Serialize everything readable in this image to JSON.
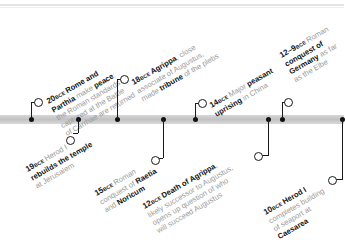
{
  "timeline": {
    "events": [
      {
        "id": "20bce",
        "year": "20",
        "era": "BCE",
        "lines": [
          [
            {
              "t": "Rome and",
              "b": true
            }
          ],
          [
            {
              "t": "Parthia",
              "b": true
            },
            {
              "t": " make ",
              "b": false
            },
            {
              "t": "peace",
              "b": true
            },
            {
              "t": ":",
              "b": false
            }
          ],
          [
            {
              "t": "the Roman standards",
              "b": false
            }
          ],
          [
            {
              "t": "captured at the Battle",
              "b": false
            }
          ],
          [
            {
              "t": "of Carrhae are returned",
              "b": false
            }
          ]
        ],
        "position": "above"
      },
      {
        "id": "19bce",
        "year": "19",
        "era": "BCE",
        "lines": [
          [
            {
              "t": "Herod I",
              "b": false
            }
          ],
          [
            {
              "t": "rebuilds the temple",
              "b": true
            }
          ],
          [
            {
              "t": "at Jerusalem",
              "b": false
            }
          ]
        ],
        "position": "below"
      },
      {
        "id": "18bce",
        "year": "18",
        "era": "BCE",
        "lines": [
          [
            {
              "t": "Agrippa",
              "b": true
            },
            {
              "t": ", close",
              "b": false
            }
          ],
          [
            {
              "t": "associate of Augustus,",
              "b": false
            }
          ],
          [
            {
              "t": "made ",
              "b": false
            },
            {
              "t": "tribune",
              "b": true
            },
            {
              "t": " of the plebs",
              "b": false
            }
          ]
        ],
        "position": "above"
      },
      {
        "id": "15bce",
        "year": "15",
        "era": "BCE",
        "lines": [
          [
            {
              "t": "Roman",
              "b": false
            }
          ],
          [
            {
              "t": "conquest of ",
              "b": false
            },
            {
              "t": "Raetia",
              "b": true
            }
          ],
          [
            {
              "t": "and ",
              "b": false
            },
            {
              "t": "Noricum",
              "b": true
            }
          ]
        ],
        "position": "below"
      },
      {
        "id": "14bce",
        "year": "14",
        "era": "BCE",
        "lines": [
          [
            {
              "t": "Major ",
              "b": false
            },
            {
              "t": "peasant",
              "b": true
            }
          ],
          [
            {
              "t": "uprising",
              "b": true
            },
            {
              "t": " in China",
              "b": false
            }
          ]
        ],
        "position": "above"
      },
      {
        "id": "12bce",
        "year": "12",
        "era": "BCE",
        "lines": [
          [
            {
              "t": "Death of Agrippa",
              "b": true
            },
            {
              "t": ",",
              "b": false
            }
          ],
          [
            {
              "t": "likely successor to Augustus,",
              "b": false
            }
          ],
          [
            {
              "t": "opens up question of who",
              "b": false
            }
          ],
          [
            {
              "t": "will succeed Augustus",
              "b": false
            }
          ]
        ],
        "position": "below"
      },
      {
        "id": "12-9bce",
        "year": "12–9",
        "era": "BCE",
        "lines": [
          [
            {
              "t": "Roman",
              "b": false
            }
          ],
          [
            {
              "t": "conquest of",
              "b": true
            }
          ],
          [
            {
              "t": "Germany",
              "b": true
            },
            {
              "t": " as far",
              "b": false
            }
          ],
          [
            {
              "t": "as the Elbe",
              "b": false
            }
          ]
        ],
        "position": "above"
      },
      {
        "id": "10bce",
        "year": "10",
        "era": "BCE",
        "lines": [
          [
            {
              "t": "Herod I",
              "b": true
            }
          ],
          [
            {
              "t": "completes building",
              "b": false
            }
          ],
          [
            {
              "t": "of seaport at",
              "b": false
            }
          ],
          [
            {
              "t": "Caesarea",
              "b": true
            }
          ]
        ],
        "position": "below"
      }
    ]
  },
  "colors": {
    "bar": "#c8c8c8",
    "connector": "#1a1a1a",
    "highlight_text": "#111111",
    "body_text": "#9a9a9a"
  }
}
